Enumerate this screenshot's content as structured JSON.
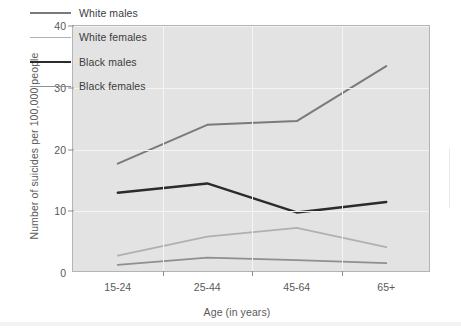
{
  "chart_data": {
    "type": "line",
    "title": "",
    "xlabel": "Age (in years)",
    "ylabel": "Number of suicides per 100,000 people",
    "categories": [
      "15-24",
      "25-44",
      "45-64",
      "65+"
    ],
    "ylim": [
      0,
      40
    ],
    "yticks": [
      0,
      10,
      20,
      30,
      40
    ],
    "grid": true,
    "legend_position": "top-left",
    "series": [
      {
        "name": "White males",
        "color": "#7a7a7a",
        "width": 2.0,
        "values": [
          17.7,
          24.0,
          24.6,
          33.5
        ]
      },
      {
        "name": "White females",
        "color": "#b0b0b0",
        "width": 1.8,
        "values": [
          2.8,
          5.9,
          7.3,
          4.2
        ]
      },
      {
        "name": "Black males",
        "color": "#2b2b2b",
        "width": 2.4,
        "values": [
          13.0,
          14.5,
          9.8,
          11.5
        ]
      },
      {
        "name": "Black females",
        "color": "#8f8f8f",
        "width": 1.8,
        "values": [
          1.3,
          2.5,
          2.1,
          1.6
        ]
      }
    ]
  },
  "axes": {
    "ytick_labels": [
      "0",
      "10",
      "20",
      "30",
      "40"
    ],
    "xtick_labels": [
      "15-24",
      "25-44",
      "45-64",
      "65+"
    ],
    "xlabel": "Age (in years)",
    "ylabel": "Number of suicides per 100,000 people"
  },
  "legend": {
    "items": [
      {
        "label": "White males"
      },
      {
        "label": "White females"
      },
      {
        "label": "Black males"
      },
      {
        "label": "Black females"
      }
    ]
  },
  "colors": {
    "plot_background": "#e3e3e3",
    "page_background": "#ffffff",
    "gridline": "#f4f4f4",
    "axis": "#b4b4b4",
    "text": "#595959"
  }
}
